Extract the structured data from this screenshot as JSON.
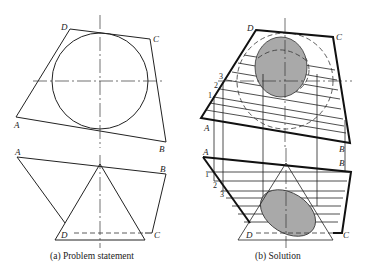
{
  "figure": {
    "panels": [
      {
        "id": "a",
        "caption": "(a) Problem statement",
        "top_view_labels": {
          "A": "A",
          "B": "B",
          "C": "C",
          "D": "D"
        },
        "front_view_labels": {
          "A": "A",
          "B": "B",
          "C": "C",
          "D": "D"
        }
      },
      {
        "id": "b",
        "caption": "(b) Solution",
        "top_view_labels": {
          "A": "A",
          "B": "B",
          "C": "C",
          "D": "D"
        },
        "front_view_labels": {
          "A": "A",
          "B": "B",
          "C": "C",
          "D": "D"
        },
        "cutting_plane_numbers_top": [
          "1",
          "2",
          "3"
        ],
        "cutting_plane_numbers_front": [
          "1",
          "2",
          "3"
        ]
      }
    ],
    "shading_color": "#a9a9a9",
    "line_color": "#222222"
  }
}
